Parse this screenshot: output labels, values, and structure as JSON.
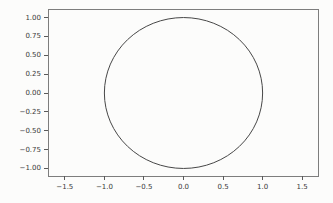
{
  "figure": {
    "background_color": "#fcfcfb",
    "spine_color": "#7d7d7d",
    "tick_color": "#5a5a5a",
    "tick_label_color": "#3a3a3a"
  },
  "chart_data": {
    "type": "line",
    "title": "",
    "xlabel": "",
    "ylabel": "",
    "xlim": [
      -1.7,
      1.7
    ],
    "ylim": [
      -1.1,
      1.1
    ],
    "grid": false,
    "legend": false,
    "x_ticks": {
      "values": [
        -1.5,
        -1.0,
        -0.5,
        0.0,
        0.5,
        1.0,
        1.5
      ],
      "labels": [
        "−1.5",
        "−1.0",
        "−0.5",
        "0.0",
        "0.5",
        "1.0",
        "1.5"
      ]
    },
    "y_ticks": {
      "values": [
        1.0,
        0.75,
        0.5,
        0.25,
        0.0,
        -0.25,
        -0.5,
        -0.75,
        -1.0
      ],
      "labels": [
        "1.00",
        "0.75",
        "0.50",
        "0.25",
        "0.00",
        "−0.25",
        "−0.50",
        "−0.75",
        "−1.00"
      ]
    },
    "series": [
      {
        "name": "circle",
        "kind": "circle",
        "center": [
          0,
          0
        ],
        "radius": 1.0,
        "color": "#474747",
        "linewidth": 1
      }
    ]
  }
}
